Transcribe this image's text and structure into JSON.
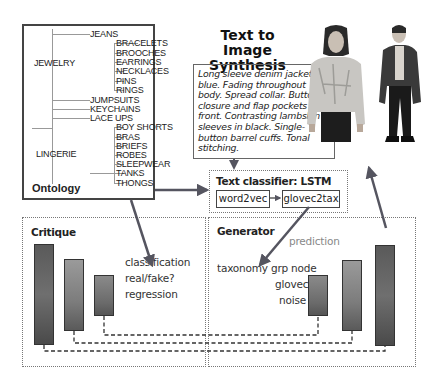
{
  "title": "Text to Image Synthesis",
  "ontology": {
    "label": "Ontology",
    "groups": [
      {
        "name": "JEWELRY",
        "children": [
          "BRACELETS",
          "BROOCHES",
          "EARRINGS",
          "NECKLACES",
          "PINS",
          "RINGS"
        ]
      },
      {
        "name": "LINGERIE",
        "children": [
          "BOY SHORTS",
          "BRAS",
          "BRIEFS",
          "ROBES",
          "SLEEPWEAR",
          "TANKS",
          "THONGS"
        ]
      }
    ],
    "leaves": [
      "JEANS",
      "JUMPSUITS",
      "KEYCHAINS",
      "LACE UPS"
    ],
    "items": {
      "jeans": "JEANS",
      "jewelry": "JEWELRY",
      "bracelets": "BRACELETS",
      "brooches": "BROOCHES",
      "earrings": "EARRINGS",
      "necklaces": "NECKLACES",
      "pins": "PINS",
      "rings": "RINGS",
      "jumpsuits": "JUMPSUITS",
      "keychains": "KEYCHAINS",
      "lace_ups": "LACE UPS",
      "lingerie": "LINGERIE",
      "boy_shorts": "BOY SHORTS",
      "bras": "BRAS",
      "briefs": "BRIEFS",
      "robes": "ROBES",
      "sleepwear": "SLEEPWEAR",
      "tanks": "TANKS",
      "thongs": "THONGS"
    }
  },
  "description": "Long sleeve denim jacket in blue. Fading throughout body. Spread collar. Button closure and flap pockets at front. Contrasting lambskin sleeves in black. Single-button barrel cuffs. Tonal stitching.",
  "text_classifier": {
    "title": "Text classifier: LSTM",
    "box1": "word2vec",
    "box2": "glovec2tax"
  },
  "critique": {
    "title": "Critique",
    "outputs": [
      "classification",
      "real/fake?",
      "regression"
    ]
  },
  "generator": {
    "title": "Generator",
    "prediction_label": "prediction",
    "inputs": [
      "taxonomy grp node",
      "glovec",
      "noise"
    ]
  },
  "images": [
    "model-denim-jacket-front",
    "model-dark-jacket-full"
  ],
  "colors": {
    "arrow": "#555560",
    "bar_dark": "#5a5a5a",
    "bar_light": "#9a9a9a",
    "border": "#444444",
    "dotted": "#777777"
  }
}
